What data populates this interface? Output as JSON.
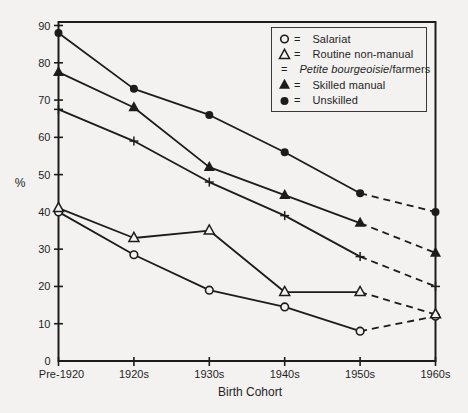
{
  "chart_data": {
    "type": "line",
    "title": "",
    "xlabel": "Birth Cohort",
    "ylabel": "%",
    "categories": [
      "Pre-1920",
      "1920s",
      "1930s",
      "1940s",
      "1950s",
      "1960s"
    ],
    "ylim": [
      0,
      90
    ],
    "ytick_step": 10,
    "grid": false,
    "legend_position": "top-right",
    "legend_separator": "=",
    "dashed_final_segment": true,
    "series": [
      {
        "name": "Salariat",
        "marker": "open-circle",
        "values": [
          40,
          28.5,
          19,
          14.5,
          8,
          12
        ]
      },
      {
        "name": "Routine non-manual",
        "marker": "open-triangle",
        "values": [
          41,
          33,
          35,
          18.5,
          18.5,
          12.5
        ]
      },
      {
        "name": "Petite bourgeoisie/farmers",
        "marker": "plus",
        "italic_prefix": "Petite bourgeoisie",
        "values": [
          67.5,
          59,
          48,
          39,
          28,
          20
        ]
      },
      {
        "name": "Skilled manual",
        "marker": "filled-triangle",
        "values": [
          77.5,
          68,
          52,
          44.5,
          37,
          29
        ]
      },
      {
        "name": "Unskilled",
        "marker": "filled-circle",
        "values": [
          88,
          73,
          66,
          56,
          45,
          40
        ]
      }
    ],
    "colors": {
      "line": "#1c1c1c",
      "text": "#1f1f1f",
      "paper": "#f3f2f0",
      "legend_border": "#3a3a3a"
    }
  }
}
